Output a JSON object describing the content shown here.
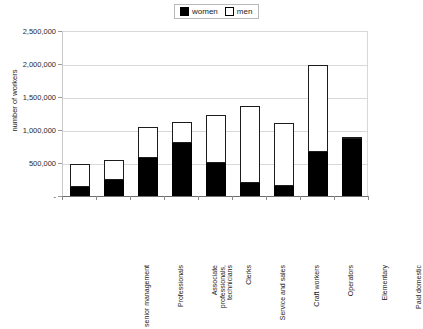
{
  "legend": {
    "position": "top-center",
    "entries": [
      {
        "label": "women",
        "swatch": "filled-black-square"
      },
      {
        "label": "men",
        "swatch": "outlined-white-square"
      }
    ]
  },
  "axes": {
    "ylabel": "number of workers",
    "ytick_labels": [
      "2,500,000",
      "2,000,000",
      "1,500,000",
      "1,000,000",
      "500,000",
      "-"
    ]
  },
  "chart_data": {
    "type": "bar",
    "stacked": true,
    "title": "",
    "xlabel": "",
    "ylabel": "number of workers",
    "ylim": [
      0,
      2500000
    ],
    "ytick_values": [
      0,
      500000,
      1000000,
      1500000,
      2000000,
      2500000
    ],
    "grid": true,
    "legend_position": "top-center",
    "categories": [
      "senior management",
      "Professionals",
      "Associate professionals, technicians",
      "Clerks",
      "Service and sales",
      "Craft workers",
      "Operators",
      "Elementary",
      "Paid domestic"
    ],
    "series": [
      {
        "name": "women",
        "color": "#000000",
        "values": [
          140000,
          250000,
          580000,
          800000,
          500000,
          200000,
          150000,
          660000,
          870000
        ]
      },
      {
        "name": "men",
        "color": "#ffffff",
        "values": [
          350000,
          290000,
          470000,
          320000,
          720000,
          1160000,
          950000,
          1320000,
          20000
        ]
      }
    ],
    "totals": [
      490000,
      540000,
      1050000,
      1120000,
      1220000,
      1360000,
      1100000,
      1980000,
      890000
    ]
  }
}
